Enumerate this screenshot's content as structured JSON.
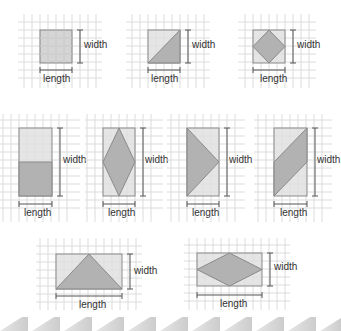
{
  "colors": {
    "grid": "#dcdcdc",
    "rect_fill": "#dedede",
    "shape_fill": "#a9a9a9",
    "outline": "#8a8a8a",
    "dimension_line": "#555555",
    "strip": "#d4d4d4"
  },
  "labels": {
    "width": "width",
    "length": "length"
  },
  "figures": [
    {
      "id": "square",
      "row": 1,
      "description": "square shaded fully",
      "width_label": "width",
      "length_label": "length"
    },
    {
      "id": "square-half-triangle",
      "row": 1,
      "description": "square divided by diagonal, lower-right triangle shaded",
      "width_label": "width",
      "length_label": "length"
    },
    {
      "id": "square-inscribed-diamond",
      "row": 1,
      "description": "square with inscribed rhombus shaded",
      "width_label": "width",
      "length_label": "length"
    },
    {
      "id": "tall-rect-bottom-half",
      "row": 2,
      "description": "tall rectangle with bottom half shaded",
      "width_label": "width",
      "length_label": "length"
    },
    {
      "id": "tall-rect-diamond",
      "row": 2,
      "description": "tall rectangle with inscribed rhombus shaded",
      "width_label": "width",
      "length_label": "length"
    },
    {
      "id": "tall-rect-side-triangle",
      "row": 2,
      "description": "tall rectangle with triangle from left edge to right midpoint shaded",
      "width_label": "width",
      "length_label": "length"
    },
    {
      "id": "tall-rect-parallelogram",
      "row": 2,
      "description": "tall rectangle with diagonal parallelogram band shaded",
      "width_label": "width",
      "length_label": "length"
    },
    {
      "id": "wide-rect-triangle",
      "row": 3,
      "description": "wide rectangle with triangle from bottom edge to top midpoint shaded",
      "width_label": "width",
      "length_label": "length"
    },
    {
      "id": "wide-rect-diamond",
      "row": 3,
      "description": "wide rectangle with inscribed rhombus shaded",
      "width_label": "width",
      "length_label": "length"
    }
  ]
}
